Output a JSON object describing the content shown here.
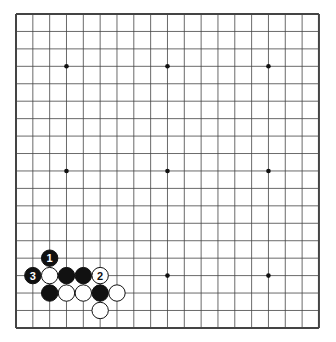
{
  "diagram": {
    "type": "go-board",
    "size": 19,
    "origin": {
      "x": 16,
      "y": 14
    },
    "spacing": {
      "x": 16.83,
      "y": 17.44
    },
    "colors": {
      "line": "#444444",
      "black": "#111111",
      "white": "#ffffff",
      "background": "#ffffff"
    },
    "star_points": [
      [
        3,
        3
      ],
      [
        9,
        3
      ],
      [
        15,
        3
      ],
      [
        3,
        9
      ],
      [
        9,
        9
      ],
      [
        15,
        9
      ],
      [
        3,
        15
      ],
      [
        9,
        15
      ],
      [
        15,
        15
      ]
    ],
    "stones": [
      {
        "col": 2,
        "row": 14,
        "color": "black",
        "label": "1"
      },
      {
        "col": 1,
        "row": 15,
        "color": "black",
        "label": "3"
      },
      {
        "col": 2,
        "row": 15,
        "color": "white",
        "label": ""
      },
      {
        "col": 3,
        "row": 15,
        "color": "black",
        "label": ""
      },
      {
        "col": 4,
        "row": 15,
        "color": "black",
        "label": ""
      },
      {
        "col": 5,
        "row": 15,
        "color": "white",
        "label": "2"
      },
      {
        "col": 2,
        "row": 16,
        "color": "black",
        "label": ""
      },
      {
        "col": 3,
        "row": 16,
        "color": "white",
        "label": ""
      },
      {
        "col": 4,
        "row": 16,
        "color": "white",
        "label": ""
      },
      {
        "col": 5,
        "row": 16,
        "color": "black",
        "label": ""
      },
      {
        "col": 6,
        "row": 16,
        "color": "white",
        "label": ""
      },
      {
        "col": 5,
        "row": 17,
        "color": "white",
        "label": ""
      }
    ]
  }
}
